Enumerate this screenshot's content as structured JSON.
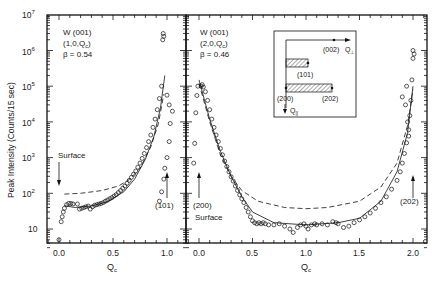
{
  "chart_data": [
    {
      "type": "scatter",
      "panel": "left",
      "annotation": [
        "W (001)",
        "(1,0,Q",
        "c",
        ")",
        "β = 0.54"
      ],
      "xlabel": "Q",
      "xlabel_sub": "c",
      "ylabel": "Peak Intensity (Counts/15 sec)",
      "yscale": "log",
      "ylim": [
        3,
        10000000
      ],
      "xlim": [
        -0.11,
        1.18
      ],
      "xticks": [
        "0.0",
        "0.5",
        "1.0"
      ],
      "yticks": [
        "10",
        "10^2",
        "10^3",
        "10^4",
        "10^5",
        "10^6",
        "10^7"
      ],
      "arrows": [
        {
          "label": "Surface",
          "x": 0.0
        },
        {
          "label": "(101)",
          "x": 1.0
        }
      ],
      "points": [
        [
          0.0,
          5
        ],
        [
          0.02,
          16
        ],
        [
          0.03,
          22
        ],
        [
          0.04,
          30
        ],
        [
          0.05,
          38
        ],
        [
          0.07,
          48
        ],
        [
          0.09,
          52
        ],
        [
          0.11,
          52
        ],
        [
          0.13,
          50
        ],
        [
          0.17,
          50
        ],
        [
          0.19,
          36
        ],
        [
          0.21,
          38
        ],
        [
          0.23,
          40
        ],
        [
          0.25,
          42
        ],
        [
          0.27,
          44
        ],
        [
          0.29,
          36
        ],
        [
          0.31,
          42
        ],
        [
          0.33,
          46
        ],
        [
          0.35,
          48
        ],
        [
          0.37,
          50
        ],
        [
          0.39,
          52
        ],
        [
          0.41,
          55
        ],
        [
          0.43,
          60
        ],
        [
          0.45,
          65
        ],
        [
          0.47,
          70
        ],
        [
          0.49,
          76
        ],
        [
          0.51,
          84
        ],
        [
          0.53,
          92
        ],
        [
          0.55,
          105
        ],
        [
          0.57,
          120
        ],
        [
          0.59,
          138
        ],
        [
          0.61,
          160
        ],
        [
          0.63,
          190
        ],
        [
          0.65,
          230
        ],
        [
          0.67,
          280
        ],
        [
          0.69,
          340
        ],
        [
          0.71,
          420
        ],
        [
          0.73,
          540
        ],
        [
          0.75,
          700
        ],
        [
          0.77,
          950
        ],
        [
          0.79,
          1300
        ],
        [
          0.81,
          1900
        ],
        [
          0.83,
          2800
        ],
        [
          0.85,
          4300
        ],
        [
          0.87,
          7000
        ],
        [
          0.89,
          12000
        ],
        [
          0.91,
          22000
        ],
        [
          0.93,
          45000
        ],
        [
          0.95,
          100000
        ],
        [
          0.96,
          2000000
        ],
        [
          0.965,
          3000000
        ],
        [
          0.97,
          2500000
        ],
        [
          0.93,
          60
        ],
        [
          0.95,
          110
        ],
        [
          0.97,
          250
        ],
        [
          0.98,
          500
        ],
        [
          1.0,
          1000
        ],
        [
          1.02,
          2800
        ],
        [
          1.03,
          9000
        ],
        [
          1.02,
          30000
        ],
        [
          1.0,
          56000
        ],
        [
          1.05,
          20000
        ]
      ],
      "solid_curve": [
        [
          0.05,
          45
        ],
        [
          0.15,
          40
        ],
        [
          0.3,
          44
        ],
        [
          0.45,
          58
        ],
        [
          0.6,
          110
        ],
        [
          0.7,
          250
        ],
        [
          0.8,
          900
        ],
        [
          0.88,
          4000
        ],
        [
          0.94,
          25000
        ],
        [
          0.98,
          200000
        ]
      ],
      "dashed_curve": [
        [
          0.05,
          95
        ],
        [
          0.2,
          100
        ],
        [
          0.4,
          120
        ],
        [
          0.55,
          160
        ],
        [
          0.65,
          240
        ],
        [
          0.75,
          500
        ],
        [
          0.85,
          2000
        ],
        [
          0.92,
          9000
        ],
        [
          0.97,
          60000
        ]
      ]
    },
    {
      "type": "scatter",
      "panel": "right",
      "annotation": [
        "W (001)",
        "(2,0,Q",
        "c",
        ")",
        "β = 0.46"
      ],
      "xlabel": "Q",
      "xlabel_sub": "c",
      "yscale": "log",
      "ylim": [
        3,
        10000000
      ],
      "xlim": [
        -0.12,
        2.12
      ],
      "xticks": [
        "0.0",
        "0.5",
        "1.0",
        "1.5",
        "2.0"
      ],
      "arrows": [
        {
          "label": "(200)",
          "sublabel": "Surface",
          "x": 0.0
        },
        {
          "label": "(202)",
          "x": 2.0
        }
      ],
      "points": [
        [
          0.02,
          100000
        ],
        [
          0.03,
          110000
        ],
        [
          0.04,
          95000
        ],
        [
          0.06,
          70000
        ],
        [
          0.08,
          40000
        ],
        [
          0.1,
          22000
        ],
        [
          0.12,
          12000
        ],
        [
          0.14,
          7000
        ],
        [
          0.16,
          4300
        ],
        [
          0.18,
          2800
        ],
        [
          0.2,
          1800
        ],
        [
          0.22,
          1200
        ],
        [
          0.24,
          800
        ],
        [
          0.26,
          560
        ],
        [
          0.28,
          400
        ],
        [
          0.3,
          290
        ],
        [
          0.32,
          220
        ],
        [
          0.34,
          160
        ],
        [
          0.36,
          120
        ],
        [
          0.38,
          90
        ],
        [
          0.4,
          70
        ],
        [
          0.42,
          55
        ],
        [
          0.44,
          40
        ],
        [
          0.46,
          30
        ],
        [
          0.48,
          22
        ],
        [
          0.5,
          17
        ],
        [
          0.52,
          15
        ],
        [
          0.54,
          14
        ],
        [
          0.56,
          15
        ],
        [
          0.58,
          14
        ],
        [
          0.6,
          15
        ],
        [
          0.62,
          14
        ],
        [
          0.65,
          13
        ],
        [
          0.7,
          13
        ],
        [
          0.75,
          14
        ],
        [
          0.8,
          12
        ],
        [
          0.85,
          10
        ],
        [
          0.88,
          8
        ],
        [
          0.92,
          11
        ],
        [
          0.95,
          13
        ],
        [
          0.98,
          14
        ],
        [
          1.0,
          12
        ],
        [
          1.02,
          10
        ],
        [
          1.05,
          13
        ],
        [
          1.08,
          14
        ],
        [
          1.1,
          13
        ],
        [
          1.15,
          14
        ],
        [
          1.2,
          13
        ],
        [
          1.25,
          16
        ],
        [
          1.28,
          15
        ],
        [
          1.3,
          14
        ],
        [
          1.35,
          11
        ],
        [
          1.4,
          12
        ],
        [
          1.45,
          15
        ],
        [
          1.5,
          18
        ],
        [
          1.55,
          22
        ],
        [
          1.6,
          28
        ],
        [
          1.65,
          38
        ],
        [
          1.7,
          55
        ],
        [
          1.75,
          80
        ],
        [
          1.8,
          130
        ],
        [
          1.85,
          230
        ],
        [
          1.88,
          400
        ],
        [
          1.9,
          700
        ],
        [
          1.92,
          1300
        ],
        [
          1.94,
          2600
        ],
        [
          1.96,
          6000
        ],
        [
          1.97,
          15000
        ],
        [
          1.98,
          40000
        ],
        [
          1.99,
          150000
        ],
        [
          2.0,
          600000
        ],
        [
          2.0,
          1000000
        ],
        [
          2.01,
          800000
        ],
        [
          -0.05,
          700
        ],
        [
          -0.04,
          2500
        ],
        [
          -0.03,
          18000
        ],
        [
          -0.02,
          55000
        ],
        [
          -0.01,
          100000
        ],
        [
          1.96,
          4000
        ],
        [
          1.95,
          10000
        ],
        [
          1.93,
          30000
        ],
        [
          1.9,
          50000
        ],
        [
          1.94,
          100000
        ]
      ],
      "solid_curve": [
        [
          0.0,
          150000
        ],
        [
          0.1,
          12000
        ],
        [
          0.2,
          1500
        ],
        [
          0.3,
          300
        ],
        [
          0.4,
          80
        ],
        [
          0.5,
          30
        ],
        [
          0.7,
          15
        ],
        [
          1.0,
          13
        ],
        [
          1.3,
          15
        ],
        [
          1.5,
          20
        ],
        [
          1.7,
          60
        ],
        [
          1.85,
          400
        ],
        [
          1.95,
          5000
        ],
        [
          2.0,
          100000
        ]
      ],
      "dashed_curve": [
        [
          0.0,
          120000
        ],
        [
          0.1,
          10000
        ],
        [
          0.2,
          1200
        ],
        [
          0.3,
          300
        ],
        [
          0.4,
          120
        ],
        [
          0.55,
          60
        ],
        [
          0.8,
          40
        ],
        [
          1.0,
          37
        ],
        [
          1.2,
          40
        ],
        [
          1.5,
          60
        ],
        [
          1.7,
          150
        ],
        [
          1.85,
          700
        ],
        [
          1.95,
          8000
        ],
        [
          2.0,
          80000
        ]
      ]
    }
  ],
  "inset": {
    "labels": {
      "q_perp": "Q",
      "q_perp_sub": "⊥",
      "q_par": "Q",
      "q_par_sub": "||",
      "p002": "(002)",
      "p101": "(101)",
      "p200": "(200)",
      "p202": "(202)"
    }
  },
  "text": {
    "ylabel": "Peak Intensity (Counts/15 sec)",
    "left": {
      "l1": "W (001)",
      "l2a": "(1,0,Q",
      "l2sub": "c",
      "l2b": ")",
      "beta": "β = 0.54",
      "surface": "Surface",
      "arrow101": "(101)",
      "xlabel": "Q",
      "xsub": "c"
    },
    "right": {
      "l1": "W (001)",
      "l2a": "(2,0,Q",
      "l2sub": "c",
      "l2b": ")",
      "beta": "β = 0.46",
      "arrow200": "(200)",
      "surface": "Surface",
      "arrow202": "(202)",
      "xlabel": "Q",
      "xsub": "c"
    },
    "yticks": {
      "t7": "7",
      "t6": "6",
      "t5": "5",
      "t4": "4",
      "t3": "3",
      "t2": "2",
      "base": "10",
      "t1": "10"
    },
    "xticks_left": [
      "0.0",
      "0.5",
      "1.0"
    ],
    "xticks_right": [
      "0.0",
      "0.5",
      "1.0",
      "1.5",
      "2.0"
    ]
  }
}
